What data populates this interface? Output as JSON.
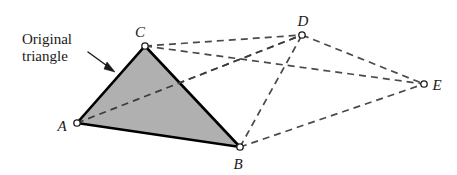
{
  "figure": {
    "background_color": "#ffffff",
    "width": 457,
    "height": 175
  },
  "callout": {
    "line1": "Original",
    "line2": "triangle",
    "arrow_name": "pointer-arrow",
    "arrow_from": [
      88,
      52
    ],
    "arrow_to": [
      114,
      71
    ],
    "text_color": "#1a1a1a"
  },
  "style": {
    "solid_stroke_color": "#000000",
    "solid_stroke_width": 2.6,
    "dashed_stroke_color": "#4a4a4a",
    "dashed_stroke_width": 1.7,
    "dash_pattern": "7,5",
    "triangle_fill": "#b0b0b0",
    "marker_fill": "#ffffff",
    "marker_stroke": "#1a1a1a",
    "marker_radius": 3.2
  },
  "points": [
    {
      "id": "A",
      "label": "A",
      "x": 77,
      "y": 123,
      "label_x": 62,
      "label_y": 131
    },
    {
      "id": "B",
      "label": "B",
      "x": 240,
      "y": 147,
      "label_x": 235,
      "label_y": 169
    },
    {
      "id": "C",
      "label": "C",
      "x": 145,
      "y": 46,
      "label_x": 137,
      "label_y": 37
    },
    {
      "id": "D",
      "label": "D",
      "x": 302,
      "y": 35,
      "label_x": 299,
      "label_y": 26
    },
    {
      "id": "E",
      "label": "E",
      "x": 424,
      "y": 84,
      "label_x": 433,
      "label_y": 90
    }
  ],
  "solid_triangle": {
    "name": "original-triangle",
    "vertices": [
      "A",
      "B",
      "C"
    ],
    "points_attr": "77,123 240,147 145,46"
  },
  "dashed_edges": [
    {
      "id": "CD",
      "from": "C",
      "to": "D",
      "x1": 145,
      "y1": 46,
      "x2": 302,
      "y2": 35
    },
    {
      "id": "CE",
      "from": "C",
      "to": "E",
      "x1": 145,
      "y1": 46,
      "x2": 424,
      "y2": 84
    },
    {
      "id": "AD",
      "from": "A",
      "to": "D",
      "x1": 77,
      "y1": 123,
      "x2": 302,
      "y2": 35
    },
    {
      "id": "BD",
      "from": "B",
      "to": "D",
      "x1": 240,
      "y1": 147,
      "x2": 302,
      "y2": 35
    },
    {
      "id": "BE",
      "from": "B",
      "to": "E",
      "x1": 240,
      "y1": 147,
      "x2": 424,
      "y2": 84
    },
    {
      "id": "DE",
      "from": "D",
      "to": "E",
      "x1": 302,
      "y1": 35,
      "x2": 424,
      "y2": 84
    }
  ]
}
